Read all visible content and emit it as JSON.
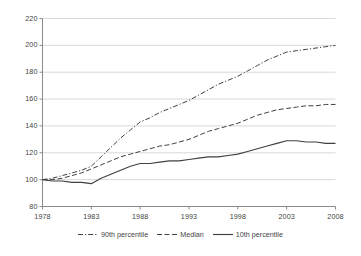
{
  "chart_data": {
    "type": "line",
    "title": "",
    "subtitle": "",
    "xlabel": "",
    "ylabel": "",
    "xlim": [
      1978,
      2008
    ],
    "ylim": [
      80,
      220
    ],
    "ytick_step": 20,
    "xtick_step": 5,
    "grid": "horizontal",
    "legend_position": "bottom",
    "x": [
      1978,
      1979,
      1980,
      1981,
      1982,
      1983,
      1984,
      1985,
      1986,
      1987,
      1988,
      1989,
      1990,
      1991,
      1992,
      1993,
      1994,
      1995,
      1996,
      1997,
      1998,
      1999,
      2000,
      2001,
      2002,
      2003,
      2004,
      2005,
      2006,
      2007,
      2008
    ],
    "xticks": [
      1978,
      1983,
      1988,
      1993,
      1998,
      2003,
      2008
    ],
    "xtick_labels": [
      "1978",
      "1983",
      "1988",
      "1993",
      "1998",
      "2003",
      "2008"
    ],
    "yticks": [
      80,
      100,
      120,
      140,
      160,
      180,
      200,
      220
    ],
    "ytick_labels": [
      "80",
      "100",
      "120",
      "140",
      "160",
      "180",
      "200",
      "220"
    ],
    "series": [
      {
        "name": "90th percentile",
        "style": "dashdot",
        "color": "#404040",
        "values": [
          100,
          101,
          103,
          105,
          107,
          110,
          117,
          124,
          131,
          137,
          143,
          146,
          150,
          153,
          156,
          159,
          163,
          167,
          171,
          174,
          177,
          181,
          185,
          189,
          192,
          195,
          196,
          197,
          198,
          199,
          200
        ]
      },
      {
        "name": "Median",
        "style": "dashed",
        "color": "#404040",
        "values": [
          100,
          100,
          101,
          103,
          105,
          108,
          111,
          114,
          117,
          119,
          121,
          123,
          125,
          126,
          128,
          130,
          133,
          136,
          138,
          140,
          142,
          145,
          148,
          150,
          152,
          153,
          154,
          155,
          155,
          156,
          156
        ]
      },
      {
        "name": "10th percentile",
        "style": "solid",
        "color": "#404040",
        "values": [
          100,
          99,
          99,
          98,
          98,
          97,
          101,
          104,
          107,
          110,
          112,
          112,
          113,
          114,
          114,
          115,
          116,
          117,
          117,
          118,
          119,
          121,
          123,
          125,
          127,
          129,
          129,
          128,
          128,
          127,
          127
        ]
      }
    ]
  },
  "legend": {
    "items": [
      {
        "label": "90th percentile"
      },
      {
        "label": "Median"
      },
      {
        "label": "10th percentile"
      }
    ]
  },
  "colors": {
    "axis": "#8a8a8a",
    "grid": "#d9d9d9",
    "text": "#3f3f3f",
    "line": "#404040",
    "background": "#ffffff"
  }
}
